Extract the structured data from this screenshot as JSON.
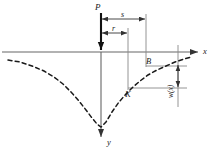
{
  "figure": {
    "axes": {
      "x_label": "x",
      "y_label": "y",
      "x_axis_y": 52,
      "y_axis_x": 101,
      "x_axis_start": 2,
      "x_axis_end": 196,
      "y_axis_end": 139
    },
    "labels": [
      {
        "name": "load-label-P",
        "text": "P",
        "x": 97,
        "y": 9
      },
      {
        "name": "dimension-label-s",
        "text": "s",
        "x": 121,
        "y": 15
      },
      {
        "name": "dimension-label-r",
        "text": "r",
        "x": 113,
        "y": 29
      },
      {
        "name": "point-label-B",
        "text": "B",
        "x": 148,
        "y": 62
      },
      {
        "name": "point-label-K",
        "text": "K",
        "x": 128,
        "y": 95
      },
      {
        "name": "axis-label-x",
        "text": "x",
        "x": 203,
        "y": 51
      },
      {
        "name": "axis-label-y",
        "text": "y",
        "x": 108,
        "y": 143
      },
      {
        "name": "deflection-label-wx",
        "text": "w(x)",
        "x": 174,
        "y": 95
      }
    ],
    "dimensions": {
      "s": {
        "from_x": 101,
        "to_x": 146,
        "y": 19
      },
      "r": {
        "from_x": 101,
        "to_x": 128,
        "y": 33
      },
      "w": {
        "x": 178,
        "from_y": 64,
        "to_y": 88
      }
    },
    "guides": {
      "vertical_s": {
        "x": 146,
        "from_y": 14,
        "to_y": 66
      },
      "vertical_r": {
        "x": 128,
        "from_y": 28,
        "to_y": 90
      },
      "vertical_w": {
        "x": 178,
        "from_y": 44,
        "to_y": 106
      },
      "horizontal_B": {
        "from_x": 146,
        "to_x": 186,
        "y": 66
      },
      "horizontal_K": {
        "from_x": 128,
        "to_x": 186,
        "y": 88
      }
    },
    "load_arrow": {
      "x": 101,
      "from_y": 12,
      "to_y": 52
    },
    "curve": {
      "name": "deflection-curve",
      "style": "dashed",
      "points": "8,60 20,62 32,66 44,71 54,77 63,84 71,92 79,101 86,110 92,118 97,124 101,127 106,122 112,112 119,102 126,94 133,87 140,81 148,75 157,70 166,66 175,62 184,59 192,57"
    },
    "colors": {
      "line": "#1a1a1a",
      "axis": "#555555",
      "guide": "#777777",
      "background": "#ffffff"
    }
  }
}
